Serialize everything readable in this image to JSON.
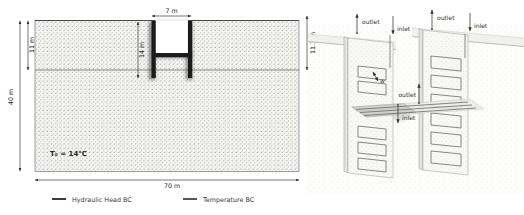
{
  "panels": {
    "left": {
      "dims": {
        "top_width": "7 m",
        "wall_depth": "14 m",
        "upstream_head": "11 m",
        "domain_height": "40 m",
        "domain_width": "70 m",
        "downstream_head": "11.3 m"
      },
      "ground_temperature": "T₀ = 14°C",
      "legend": [
        {
          "label": "Hydraulic Head BC",
          "color": "#3b3b45"
        },
        {
          "label": "Temperature BC",
          "color": "#55555e"
        }
      ]
    },
    "right": {
      "labels": {
        "outlet_top_left": "outlet",
        "inlet_top_left": "inlet",
        "outlet_top_right": "outlet",
        "inlet_top_right": "inlet",
        "outlet_mid": "outlet",
        "inlet_mid": "inlet",
        "pipe_spacing": "w"
      }
    }
  },
  "colors": {
    "wall": "#1b1b1b",
    "mesh_dot": "#7e7e7e"
  }
}
